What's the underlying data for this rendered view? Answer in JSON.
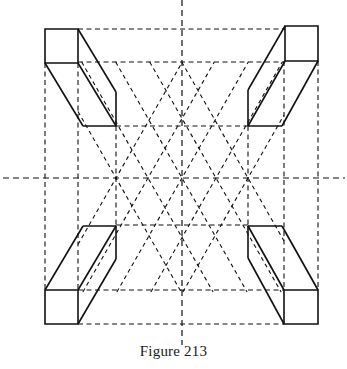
{
  "figure": {
    "caption": "Figure 213",
    "stroke_color": "#111111",
    "background": "#ffffff",
    "center_axes": {
      "vertical": {
        "x": 182,
        "y1": 0,
        "y2": 345
      },
      "horizontal": {
        "y": 178,
        "x1": 3,
        "x2": 345
      }
    },
    "guide_verticals": [
      {
        "x": 45,
        "y1": 63,
        "y2": 290
      },
      {
        "x": 78,
        "y1": 63,
        "y2": 290
      },
      {
        "x": 116,
        "y1": 126,
        "y2": 225
      },
      {
        "x": 248,
        "y1": 126,
        "y2": 225
      },
      {
        "x": 284,
        "y1": 61,
        "y2": 290
      },
      {
        "x": 318,
        "y1": 61,
        "y2": 290
      }
    ],
    "guide_horizontals": [
      {
        "y": 29,
        "x1": 78,
        "x2": 285
      },
      {
        "y": 62,
        "x1": 78,
        "x2": 285
      },
      {
        "y": 126,
        "x1": 116,
        "x2": 248
      },
      {
        "y": 225,
        "x1": 116,
        "x2": 248
      },
      {
        "y": 290,
        "x1": 78,
        "x2": 284
      },
      {
        "y": 324,
        "x1": 78,
        "x2": 284
      }
    ],
    "lattice": {
      "slope": 1.75,
      "center_y": 178,
      "x_intercepts": [
        116,
        148,
        182,
        216,
        248
      ],
      "clip": {
        "x1": 78,
        "x2": 284,
        "y1": 62,
        "y2": 292
      }
    },
    "boxes": [
      {
        "name": "top-left-box",
        "front": [
          [
            45,
            29
          ],
          [
            78,
            29
          ],
          [
            78,
            63
          ],
          [
            45,
            63
          ]
        ],
        "edges": [
          [
            [
              78,
              29
            ],
            [
              116,
              92
            ]
          ],
          [
            [
              78,
              63
            ],
            [
              116,
              126
            ]
          ],
          [
            [
              45,
              63
            ],
            [
              83,
              126
            ]
          ],
          [
            [
              116,
              92
            ],
            [
              116,
              126
            ]
          ],
          [
            [
              83,
              126
            ],
            [
              116,
              126
            ]
          ]
        ]
      },
      {
        "name": "top-right-box",
        "front": [
          [
            285,
            26
          ],
          [
            318,
            26
          ],
          [
            318,
            61
          ],
          [
            285,
            61
          ]
        ],
        "edges": [
          [
            [
              285,
              26
            ],
            [
              248,
              90
            ]
          ],
          [
            [
              285,
              61
            ],
            [
              248,
              126
            ]
          ],
          [
            [
              318,
              61
            ],
            [
              282,
              126
            ]
          ],
          [
            [
              248,
              90
            ],
            [
              248,
              126
            ]
          ],
          [
            [
              248,
              126
            ],
            [
              282,
              126
            ]
          ]
        ]
      },
      {
        "name": "bottom-left-box",
        "front": [
          [
            45,
            290
          ],
          [
            78,
            290
          ],
          [
            78,
            324
          ],
          [
            45,
            324
          ]
        ],
        "edges": [
          [
            [
              45,
              290
            ],
            [
              83,
              226
            ]
          ],
          [
            [
              78,
              290
            ],
            [
              116,
              226
            ]
          ],
          [
            [
              78,
              324
            ],
            [
              116,
              259
            ]
          ],
          [
            [
              83,
              226
            ],
            [
              116,
              226
            ]
          ],
          [
            [
              116,
              226
            ],
            [
              116,
              259
            ]
          ]
        ]
      },
      {
        "name": "bottom-right-box",
        "front": [
          [
            284,
            290
          ],
          [
            318,
            290
          ],
          [
            318,
            324
          ],
          [
            284,
            324
          ]
        ],
        "edges": [
          [
            [
              248,
              226
            ],
            [
              284,
              290
            ]
          ],
          [
            [
              282,
              226
            ],
            [
              318,
              290
            ]
          ],
          [
            [
              248,
              258
            ],
            [
              284,
              324
            ]
          ],
          [
            [
              248,
              226
            ],
            [
              282,
              226
            ]
          ],
          [
            [
              248,
              226
            ],
            [
              248,
              258
            ]
          ]
        ]
      }
    ]
  }
}
